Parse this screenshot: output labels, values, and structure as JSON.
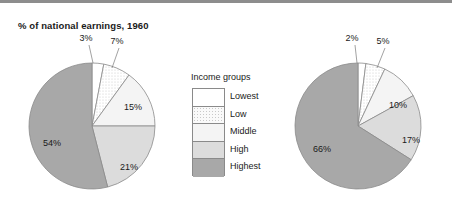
{
  "page": {
    "top_bar_color": "#8d8d8d",
    "background": "#ffffff"
  },
  "legend": {
    "title": "Income groups",
    "items": [
      {
        "label": "Lowest",
        "fill": "#ffffff",
        "pattern": "solid"
      },
      {
        "label": "Low",
        "fill": "#fafafa",
        "pattern": "dotted"
      },
      {
        "label": "Middle",
        "fill": "#f4f4f4",
        "pattern": "solid"
      },
      {
        "label": "High",
        "fill": "#dcdcdc",
        "pattern": "solid"
      },
      {
        "label": "Highest",
        "fill": "#a8a8a8",
        "pattern": "solid"
      }
    ]
  },
  "charts": [
    {
      "id": "pie-1960",
      "title": "% of national earnings, 1960",
      "center": {
        "x": 92,
        "y": 126
      },
      "radius": 63
    },
    {
      "id": "pie-1980",
      "title": "% of national earnings, 1980",
      "center": {
        "x": 358,
        "y": 126
      },
      "radius": 63
    }
  ],
  "chart_data": [
    {
      "type": "pie",
      "title": "% of national earnings, 1960",
      "categories": [
        "Lowest",
        "Low",
        "Middle",
        "High",
        "Highest"
      ],
      "values": [
        3,
        7,
        15,
        21,
        54
      ],
      "labels": [
        "3%",
        "7%",
        "15%",
        "21%",
        "54%"
      ],
      "colors": [
        "#ffffff",
        "#fafafa",
        "#f4f4f4",
        "#dcdcdc",
        "#a8a8a8"
      ],
      "start_angle_deg": 0,
      "direction": "clockwise",
      "legend_position": "center",
      "units": "percent"
    },
    {
      "type": "pie",
      "title": "% of national earnings, 1980",
      "categories": [
        "Lowest",
        "Low",
        "Middle",
        "High",
        "Highest"
      ],
      "values": [
        2,
        5,
        10,
        17,
        66
      ],
      "labels": [
        "2%",
        "5%",
        "10%",
        "17%",
        "66%"
      ],
      "colors": [
        "#ffffff",
        "#fafafa",
        "#f4f4f4",
        "#dcdcdc",
        "#a8a8a8"
      ],
      "start_angle_deg": 0,
      "direction": "clockwise",
      "legend_position": "center",
      "units": "percent"
    }
  ],
  "labels_1960": {
    "lowest": "3%",
    "low": "7%",
    "middle": "15%",
    "high": "21%",
    "highest": "54%"
  },
  "labels_1980": {
    "lowest": "2%",
    "low": "5%",
    "middle": "10%",
    "high": "17%",
    "highest": "66%"
  }
}
